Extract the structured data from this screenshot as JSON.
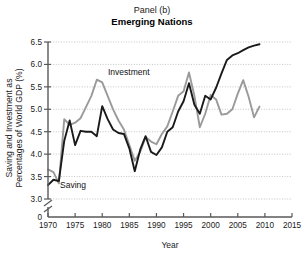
{
  "figure": {
    "panel_label": "Panel (b)",
    "title": "Emerging Nations",
    "x_axis_title": "Year",
    "y_axis_title_line1": "Saving and Investment as",
    "y_axis_title_line2": "Percentages of World GDP (%)"
  },
  "colors": {
    "saving": "#1a1a1a",
    "investment": "#9a9a9a",
    "axis": "#595959",
    "grid": "#bdbdbd",
    "text": "#1a1a1a",
    "background": "#ffffff"
  },
  "annotations": {
    "investment_label": "Investment",
    "saving_label": "Saving"
  },
  "chart_data": {
    "type": "line",
    "title": "Emerging Nations",
    "subtitle": "Panel (b)",
    "xlabel": "Year",
    "ylabel": "Saving and Investment as Percentages of World GDP (%)",
    "xlim": [
      1970,
      2015
    ],
    "ylim": [
      3.0,
      6.5
    ],
    "y_axis_break": true,
    "y_axis_break_to_zero": true,
    "grid": "horizontal-dotted",
    "legend": "inline-annotations",
    "xticks": [
      1970,
      1975,
      1980,
      1985,
      1990,
      1995,
      2000,
      2005,
      2010,
      2015
    ],
    "xtick_labels": [
      "1970",
      "1975",
      "1980",
      "1985",
      "1990",
      "1995",
      "2000",
      "2005",
      "2010",
      "2015"
    ],
    "yticks": [
      0,
      3.0,
      3.5,
      4.0,
      4.5,
      5.0,
      5.5,
      6.0,
      6.5
    ],
    "ytick_labels": [
      "0",
      "3.0",
      "3.5",
      "4.0",
      "4.5",
      "5.0",
      "5.5",
      "6.0",
      "6.5"
    ],
    "x": [
      1970,
      1971,
      1972,
      1973,
      1974,
      1975,
      1976,
      1977,
      1978,
      1979,
      1980,
      1981,
      1982,
      1983,
      1984,
      1985,
      1986,
      1987,
      1988,
      1989,
      1990,
      1991,
      1992,
      1993,
      1994,
      1995,
      1996,
      1997,
      1998,
      1999,
      2000,
      2001,
      2002,
      2003,
      2004,
      2005,
      2006,
      2007,
      2008,
      2009
    ],
    "series": [
      {
        "name": "Saving",
        "color": "#1a1a1a",
        "values": [
          3.31,
          3.43,
          3.4,
          4.3,
          4.75,
          4.2,
          4.52,
          4.5,
          4.5,
          4.4,
          5.07,
          4.78,
          4.55,
          4.47,
          4.45,
          4.13,
          3.62,
          4.1,
          4.4,
          4.05,
          3.98,
          4.15,
          4.5,
          4.6,
          4.95,
          5.18,
          5.58,
          5.1,
          4.9,
          5.3,
          5.22,
          5.48,
          5.8,
          6.1,
          6.2,
          6.25,
          6.32,
          6.38,
          6.42,
          6.45
        ]
      },
      {
        "name": "Investment",
        "color": "#9a9a9a",
        "values": [
          3.66,
          3.6,
          3.35,
          4.78,
          4.65,
          4.7,
          4.8,
          5.05,
          5.3,
          5.66,
          5.6,
          5.3,
          5.0,
          4.75,
          4.55,
          4.2,
          3.85,
          4.05,
          4.38,
          4.28,
          4.22,
          4.45,
          4.62,
          4.95,
          5.3,
          5.4,
          5.82,
          5.3,
          4.6,
          4.9,
          5.32,
          5.22,
          4.88,
          4.9,
          5.0,
          5.35,
          5.65,
          5.28,
          4.82,
          5.06
        ]
      }
    ]
  }
}
